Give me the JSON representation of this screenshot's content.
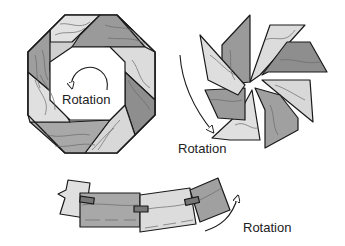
{
  "diagram": {
    "colors": {
      "light": "#e2e2e2",
      "mid": "#b5b5b5",
      "dark": "#8e8e8e",
      "outline": "#1a1a1a",
      "grain": "#6a6a6a"
    },
    "panels": [
      {
        "id": "octagon-ring",
        "label": "Rotation",
        "arrow": "counter-clockwise circular"
      },
      {
        "id": "pinwheel",
        "label": "Rotation",
        "arrow": "curved downward"
      },
      {
        "id": "joined-chain",
        "label": "Rotation",
        "arrow": "curved upward-right"
      }
    ]
  }
}
